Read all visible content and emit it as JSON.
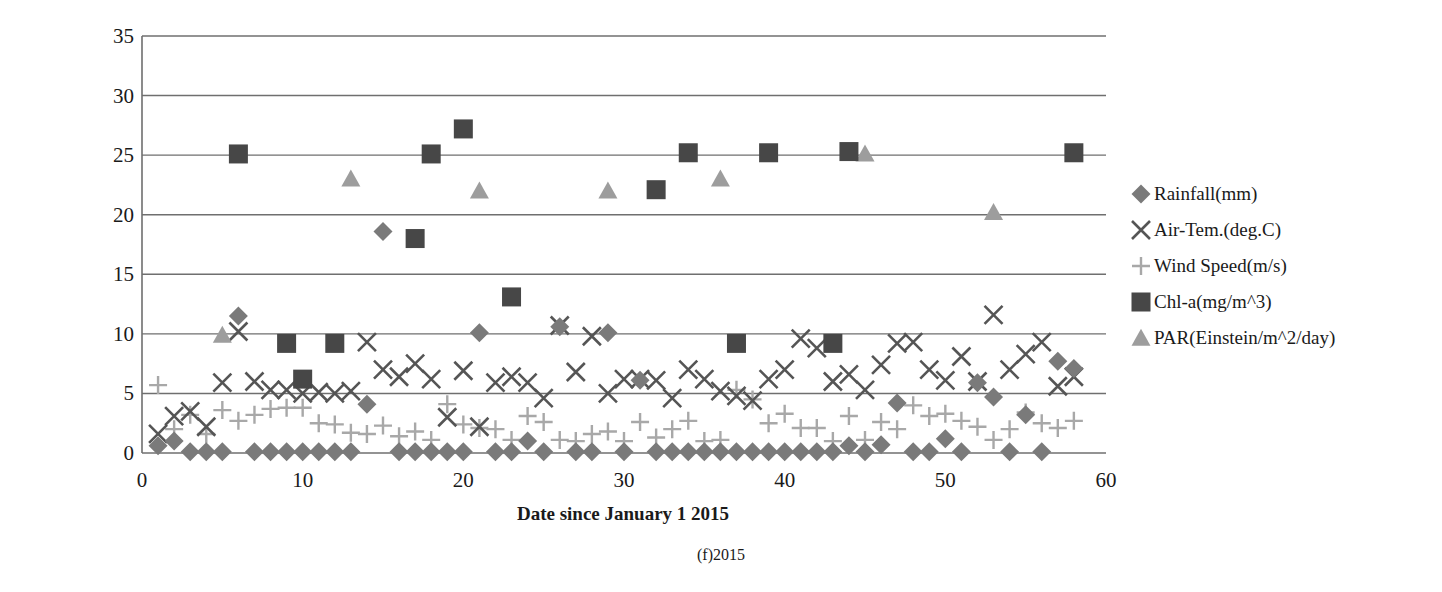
{
  "caption": "(f)2015",
  "axes": {
    "ylabel_line1": "Rainfall(mm), Air-Temperature(deg.C),",
    "ylabel_line2": "Wind Speed(m/s)",
    "xlabel": "Date since January 1 2015"
  },
  "legend": {
    "items": [
      {
        "label": "Rainfall(mm)",
        "marker": "diamond",
        "color": "#7a7a7a"
      },
      {
        "label": "Air-Tem.(deg.C)",
        "marker": "cross-x",
        "color": "#555555"
      },
      {
        "label": "Wind Speed(m/s)",
        "marker": "plus",
        "color": "#a8a8a8"
      },
      {
        "label": "Chl-a(mg/m^3)",
        "marker": "square",
        "color": "#474747"
      },
      {
        "label": "PAR(Einstein/m^2/day)",
        "marker": "triangle",
        "color": "#9d9d9d"
      }
    ]
  },
  "chart_data": {
    "type": "scatter",
    "title": "",
    "subtitle": "(f)2015",
    "xlabel": "Date since January 1 2015",
    "ylabel": "Rainfall(mm), Air-Temperature(deg.C), Wind Speed(m/s)",
    "xlim": [
      0,
      60
    ],
    "ylim": [
      0,
      35
    ],
    "xticks": [
      0,
      10,
      20,
      30,
      40,
      50,
      60
    ],
    "yticks": [
      0,
      5,
      10,
      15,
      20,
      25,
      30,
      35
    ],
    "grid": "horizontal",
    "legend_position": "right",
    "series": [
      {
        "name": "Rainfall(mm)",
        "marker": "diamond",
        "color": "#7a7a7a",
        "points": [
          [
            1,
            0.6
          ],
          [
            2,
            1.0
          ],
          [
            3,
            0.1
          ],
          [
            4,
            0.1
          ],
          [
            5,
            0.1
          ],
          [
            6,
            11.5
          ],
          [
            7,
            0.1
          ],
          [
            8,
            0.1
          ],
          [
            9,
            0.1
          ],
          [
            10,
            0.1
          ],
          [
            11,
            0.1
          ],
          [
            12,
            0.1
          ],
          [
            13,
            0.1
          ],
          [
            14,
            4.1
          ],
          [
            15,
            18.6
          ],
          [
            16,
            0.1
          ],
          [
            17,
            0.1
          ],
          [
            18,
            0.1
          ],
          [
            19,
            0.1
          ],
          [
            20,
            0.1
          ],
          [
            21,
            10.1
          ],
          [
            22,
            0.1
          ],
          [
            23,
            0.1
          ],
          [
            24,
            1.0
          ],
          [
            25,
            0.1
          ],
          [
            26,
            10.6
          ],
          [
            27,
            0.1
          ],
          [
            28,
            0.1
          ],
          [
            29,
            10.1
          ],
          [
            30,
            0.1
          ],
          [
            31,
            6.1
          ],
          [
            32,
            0.1
          ],
          [
            33,
            0.1
          ],
          [
            34,
            0.1
          ],
          [
            35,
            0.1
          ],
          [
            36,
            0.1
          ],
          [
            37,
            0.1
          ],
          [
            38,
            0.1
          ],
          [
            39,
            0.1
          ],
          [
            40,
            0.1
          ],
          [
            41,
            0.1
          ],
          [
            42,
            0.1
          ],
          [
            43,
            0.1
          ],
          [
            44,
            0.6
          ],
          [
            45,
            0.1
          ],
          [
            46,
            0.7
          ],
          [
            47,
            4.2
          ],
          [
            48,
            0.1
          ],
          [
            49,
            0.1
          ],
          [
            50,
            1.2
          ],
          [
            51,
            0.1
          ],
          [
            52,
            5.9
          ],
          [
            53,
            4.7
          ],
          [
            54,
            0.1
          ],
          [
            55,
            3.2
          ],
          [
            56,
            0.1
          ],
          [
            57,
            7.7
          ],
          [
            58,
            7.1
          ]
        ]
      },
      {
        "name": "Air-Tem.(deg.C)",
        "marker": "cross-x",
        "color": "#555555",
        "points": [
          [
            1,
            1.6
          ],
          [
            2,
            3.1
          ],
          [
            3,
            3.5
          ],
          [
            4,
            2.2
          ],
          [
            5,
            5.9
          ],
          [
            6,
            10.2
          ],
          [
            7,
            6.0
          ],
          [
            8,
            5.3
          ],
          [
            9,
            5.3
          ],
          [
            10,
            5.0
          ],
          [
            11,
            5.1
          ],
          [
            12,
            5.0
          ],
          [
            13,
            5.2
          ],
          [
            14,
            9.3
          ],
          [
            15,
            7.0
          ],
          [
            16,
            6.4
          ],
          [
            17,
            7.5
          ],
          [
            18,
            6.2
          ],
          [
            19,
            3.0
          ],
          [
            20,
            6.9
          ],
          [
            21,
            2.2
          ],
          [
            22,
            5.9
          ],
          [
            23,
            6.4
          ],
          [
            24,
            5.9
          ],
          [
            25,
            4.6
          ],
          [
            26,
            10.7
          ],
          [
            27,
            6.8
          ],
          [
            28,
            9.8
          ],
          [
            29,
            5.0
          ],
          [
            30,
            6.2
          ],
          [
            31,
            6.2
          ],
          [
            32,
            6.1
          ],
          [
            33,
            4.6
          ],
          [
            34,
            7.0
          ],
          [
            35,
            6.2
          ],
          [
            36,
            5.2
          ],
          [
            37,
            4.8
          ],
          [
            38,
            4.4
          ],
          [
            39,
            6.2
          ],
          [
            40,
            7.0
          ],
          [
            41,
            9.6
          ],
          [
            42,
            8.8
          ],
          [
            43,
            6.0
          ],
          [
            44,
            6.6
          ],
          [
            45,
            5.3
          ],
          [
            46,
            7.4
          ],
          [
            47,
            9.2
          ],
          [
            48,
            9.3
          ],
          [
            49,
            7.0
          ],
          [
            50,
            6.1
          ],
          [
            51,
            8.1
          ],
          [
            52,
            6.0
          ],
          [
            53,
            11.6
          ],
          [
            54,
            7.0
          ],
          [
            55,
            8.3
          ],
          [
            56,
            9.3
          ],
          [
            57,
            5.6
          ],
          [
            58,
            6.4
          ]
        ]
      },
      {
        "name": "Wind Speed(m/s)",
        "marker": "plus",
        "color": "#a8a8a8",
        "points": [
          [
            1,
            5.7
          ],
          [
            2,
            2.0
          ],
          [
            3,
            3.2
          ],
          [
            4,
            1.6
          ],
          [
            5,
            3.6
          ],
          [
            6,
            2.7
          ],
          [
            7,
            3.2
          ],
          [
            8,
            3.7
          ],
          [
            9,
            3.8
          ],
          [
            10,
            3.8
          ],
          [
            11,
            2.5
          ],
          [
            12,
            2.4
          ],
          [
            13,
            1.7
          ],
          [
            14,
            1.6
          ],
          [
            15,
            2.3
          ],
          [
            16,
            1.4
          ],
          [
            17,
            1.8
          ],
          [
            18,
            1.1
          ],
          [
            19,
            4.1
          ],
          [
            20,
            2.4
          ],
          [
            21,
            2.1
          ],
          [
            22,
            2.0
          ],
          [
            23,
            1.1
          ],
          [
            24,
            3.1
          ],
          [
            25,
            2.6
          ],
          [
            26,
            1.1
          ],
          [
            27,
            1.0
          ],
          [
            28,
            1.6
          ],
          [
            29,
            1.8
          ],
          [
            30,
            1.0
          ],
          [
            31,
            2.6
          ],
          [
            32,
            1.3
          ],
          [
            33,
            2.0
          ],
          [
            34,
            2.7
          ],
          [
            35,
            1.0
          ],
          [
            36,
            1.1
          ],
          [
            37,
            5.3
          ],
          [
            38,
            4.5
          ],
          [
            39,
            2.5
          ],
          [
            40,
            3.3
          ],
          [
            41,
            2.1
          ],
          [
            42,
            2.1
          ],
          [
            43,
            1.0
          ],
          [
            44,
            3.1
          ],
          [
            45,
            1.1
          ],
          [
            46,
            2.6
          ],
          [
            47,
            2.0
          ],
          [
            48,
            4.0
          ],
          [
            49,
            3.1
          ],
          [
            50,
            3.3
          ],
          [
            51,
            2.7
          ],
          [
            52,
            2.2
          ],
          [
            53,
            1.1
          ],
          [
            54,
            2.0
          ],
          [
            55,
            3.4
          ],
          [
            56,
            2.5
          ],
          [
            57,
            2.1
          ],
          [
            58,
            2.7
          ]
        ]
      },
      {
        "name": "Chl-a(mg/m^3)",
        "marker": "square",
        "color": "#474747",
        "points": [
          [
            6,
            25.1
          ],
          [
            9,
            9.2
          ],
          [
            10,
            6.2
          ],
          [
            12,
            9.2
          ],
          [
            17,
            18.0
          ],
          [
            18,
            25.1
          ],
          [
            20,
            27.2
          ],
          [
            23,
            13.1
          ],
          [
            32,
            22.1
          ],
          [
            34,
            25.2
          ],
          [
            37,
            9.2
          ],
          [
            39,
            25.2
          ],
          [
            43,
            9.2
          ],
          [
            44,
            25.3
          ],
          [
            58,
            25.2
          ]
        ]
      },
      {
        "name": "PAR(Einstein/m^2/day)",
        "marker": "triangle",
        "color": "#9d9d9d",
        "points": [
          [
            5,
            9.9
          ],
          [
            13,
            23.0
          ],
          [
            21,
            22.0
          ],
          [
            29,
            22.0
          ],
          [
            36,
            23.0
          ],
          [
            45,
            25.1
          ],
          [
            53,
            20.2
          ]
        ]
      }
    ]
  }
}
